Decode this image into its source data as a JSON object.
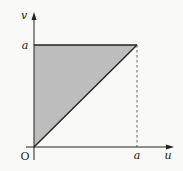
{
  "figure": {
    "axis_x_label": "u",
    "axis_y_label": "v",
    "origin_label": "O",
    "tick_x_label": "a",
    "tick_y_label": "a",
    "region": "triangle with vertices O(0,0), (0,a), (a,a)",
    "colors": {
      "background": "#f9f9f7",
      "region_fill": "#bdbdbd",
      "lines": "#222222"
    }
  }
}
